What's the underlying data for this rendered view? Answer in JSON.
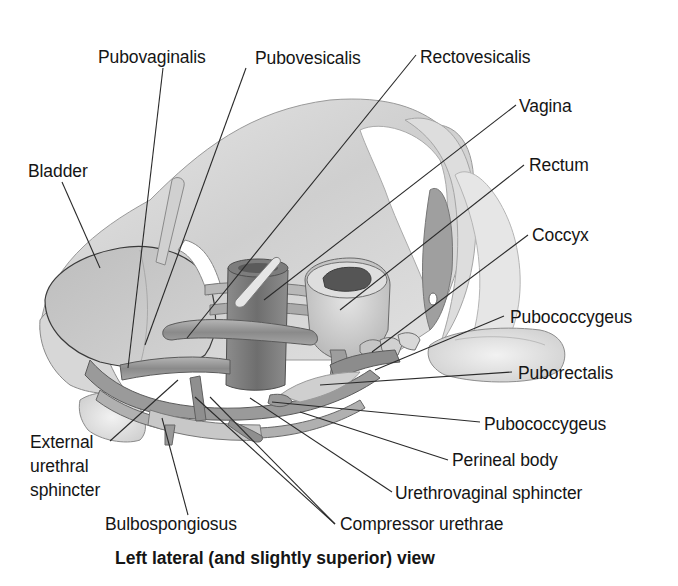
{
  "figure": {
    "caption": "Left lateral (and slightly superior) view",
    "colors": {
      "background": "#ffffff",
      "text": "#151515",
      "leader_line": "#2a2a2a",
      "tissue_light": "#d9d9d9",
      "tissue_mid": "#b0b0b0",
      "tissue_dark": "#6e6e6e"
    },
    "labels": {
      "pubovaginalis": "Pubovaginalis",
      "pubovesicalis": "Pubovesicalis",
      "rectovesicalis": "Rectovesicalis",
      "vagina": "Vagina",
      "bladder": "Bladder",
      "rectum": "Rectum",
      "coccyx": "Coccyx",
      "pubococcygeus_upper": "Pubococcygeus",
      "puborectalis": "Puborectalis",
      "pubococcygeus_lower": "Pubococcygeus",
      "perineal_body": "Perineal body",
      "urethrovaginal_sphincter": "Urethrovaginal sphincter",
      "compressor_urethrae": "Compressor urethrae",
      "bulbospongiosus": "Bulbospongiosus",
      "external_urethral_sphincter_l1": "External",
      "external_urethral_sphincter_l2": "urethral",
      "external_urethral_sphincter_l3": "sphincter"
    }
  }
}
